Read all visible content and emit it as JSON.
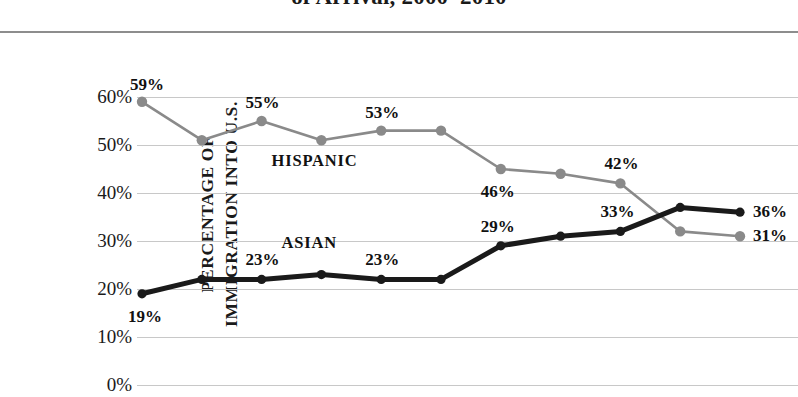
{
  "chart_data": {
    "type": "line",
    "title": "of Arrival, 2000–2010",
    "xlabel": "",
    "ylabel": "PERCENTAGE OF IMMIGRATION INTO U.S.",
    "ylabel_lines": [
      "PERCENTAGE OF",
      "IMMIGRATION INTO U.S."
    ],
    "ylim": [
      0,
      60
    ],
    "ytick_labels": [
      "60%",
      "50%",
      "40%",
      "30%",
      "20%",
      "10%",
      "0%"
    ],
    "ytick_values": [
      60,
      50,
      40,
      30,
      20,
      10,
      0
    ],
    "grid": true,
    "legend_position": "inline-annotations",
    "x": [
      1,
      2,
      3,
      4,
      5,
      6,
      7,
      8,
      9,
      10,
      11
    ],
    "series": [
      {
        "name": "HISPANIC",
        "color": "#8a8a8a",
        "values": [
          59,
          51,
          55,
          51,
          53,
          53,
          45,
          44,
          42,
          32,
          31
        ],
        "annotation_label": "HISPANIC"
      },
      {
        "name": "ASIAN",
        "color": "#1a1a1a",
        "values": [
          19,
          22,
          22,
          23,
          22,
          22,
          29,
          31,
          32,
          37,
          36
        ],
        "annotation_label": "ASIAN"
      }
    ],
    "point_labels": [
      {
        "series": "HISPANIC",
        "index": 0,
        "text": "59%"
      },
      {
        "series": "HISPANIC",
        "index": 2,
        "text": "55%"
      },
      {
        "series": "HISPANIC",
        "index": 4,
        "text": "53%"
      },
      {
        "series": "HISPANIC",
        "index": 6,
        "text": "46%"
      },
      {
        "series": "HISPANIC",
        "index": 8,
        "text": "42%"
      },
      {
        "series": "HISPANIC",
        "index": 10,
        "text": "31%"
      },
      {
        "series": "ASIAN",
        "index": 0,
        "text": "19%"
      },
      {
        "series": "ASIAN",
        "index": 2,
        "text": "23%"
      },
      {
        "series": "ASIAN",
        "index": 4,
        "text": "23%"
      },
      {
        "series": "ASIAN",
        "index": 6,
        "text": "29%"
      },
      {
        "series": "ASIAN",
        "index": 8,
        "text": "33%"
      },
      {
        "series": "ASIAN",
        "index": 10,
        "text": "36%"
      }
    ]
  },
  "colors": {
    "hispanic_line": "#8a8a8a",
    "asian_line": "#1a1a1a",
    "gridline": "#c8c8c8",
    "top_rule": "#8d8d8d",
    "background": "#ffffff",
    "text": "#1a1a1a"
  },
  "labels": {
    "title": "of Arrival, 2000–2010",
    "y_axis_line_1": "PERCENTAGE OF",
    "y_axis_line_2": "IMMIGRATION INTO U.S.",
    "annotation_hispanic": "HISPANIC",
    "annotation_asian": "ASIAN",
    "tick_60": "60%",
    "tick_50": "50%",
    "tick_40": "40%",
    "tick_30": "30%",
    "tick_20": "20%",
    "tick_10": "10%",
    "tick_0": "0%",
    "label_59": "59%",
    "label_55": "55%",
    "label_53": "53%",
    "label_46": "46%",
    "label_42": "42%",
    "label_31": "31%",
    "label_19": "19%",
    "label_23a": "23%",
    "label_23b": "23%",
    "label_29": "29%",
    "label_33": "33%",
    "label_36": "36%"
  }
}
